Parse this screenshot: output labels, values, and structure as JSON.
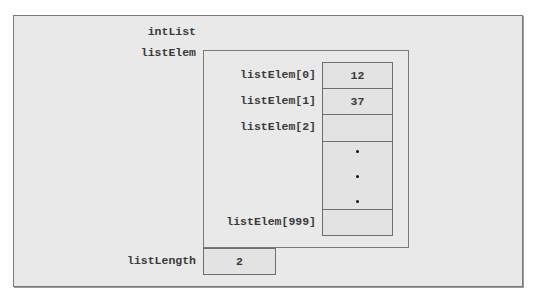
{
  "diagram": {
    "struct_name": "intList",
    "array_field": {
      "name": "listElem",
      "elements": [
        {
          "label": "listElem[0]",
          "value": "12"
        },
        {
          "label": "listElem[1]",
          "value": "37"
        },
        {
          "label": "listElem[2]",
          "value": ""
        },
        {
          "label": "",
          "value": "",
          "ellipsis": true
        },
        {
          "label": "listElem[999]",
          "value": ""
        }
      ]
    },
    "length_field": {
      "name": "listLength",
      "value": "2"
    }
  }
}
